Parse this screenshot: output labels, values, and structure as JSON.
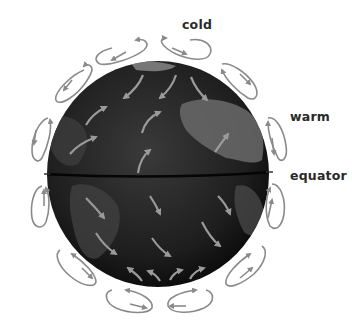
{
  "diagram": {
    "type": "atmospheric-circulation",
    "labels": {
      "top": "cold",
      "right_upper": "warm",
      "right_middle": "equator"
    },
    "globe": {
      "center": [
        158,
        173
      ],
      "radius_x": 111,
      "radius_y": 113,
      "equator_y": 176,
      "ocean_color": "#1c1c1c",
      "land_color": "#5a5a5a",
      "equator_color": "#0a0a0a"
    },
    "arrow_color": "#8a8a8a",
    "cell_count": 16,
    "surface_wind_arrow_count": 18
  }
}
